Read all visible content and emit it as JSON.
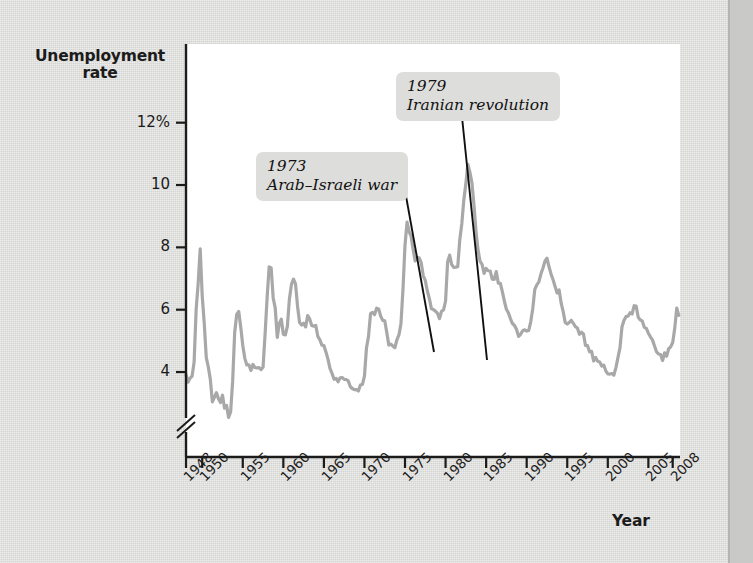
{
  "figure": {
    "background_color": "#dcdcda",
    "plot_background_color": "#ffffff",
    "line_color": "#a8a8a8",
    "axis_color": "#1b1b1b",
    "callout_bg_color": "#dddddb"
  },
  "axes": {
    "y_title": "Unemployment\nrate",
    "x_title": "Year",
    "y_ticks": [
      {
        "value": 12,
        "label": "12%"
      },
      {
        "value": 10,
        "label": "10"
      },
      {
        "value": 8,
        "label": "8"
      },
      {
        "value": 6,
        "label": "6"
      },
      {
        "value": 4,
        "label": "4"
      }
    ],
    "x_ticks": [
      {
        "value": 1948,
        "label": "1948"
      },
      {
        "value": 1950,
        "label": "1950"
      },
      {
        "value": 1955,
        "label": "1955"
      },
      {
        "value": 1960,
        "label": "1960"
      },
      {
        "value": 1965,
        "label": "1965"
      },
      {
        "value": 1970,
        "label": "1970"
      },
      {
        "value": 1975,
        "label": "1975"
      },
      {
        "value": 1980,
        "label": "1980"
      },
      {
        "value": 1985,
        "label": "1985"
      },
      {
        "value": 1990,
        "label": "1990"
      },
      {
        "value": 1995,
        "label": "1995"
      },
      {
        "value": 2000,
        "label": "2000"
      },
      {
        "value": 2005,
        "label": "2005"
      },
      {
        "value": 2008,
        "label": "2008"
      }
    ],
    "y_axis_break": true
  },
  "annotations": [
    {
      "id": "callout-1973",
      "year_label": "1973",
      "event_label": "Arab–Israeli war",
      "text": "1973\nArab–Israeli war",
      "leader_from": {
        "x": 406,
        "y": 196
      },
      "leader_to": {
        "x": 434,
        "y": 352
      }
    },
    {
      "id": "callout-1979",
      "year_label": "1979",
      "event_label": "Iranian revolution",
      "text": "1979\nIranian revolution",
      "leader_from": {
        "x": 462,
        "y": 117
      },
      "leader_to": {
        "x": 487,
        "y": 360
      }
    }
  ],
  "chart_data": {
    "type": "line",
    "title": "",
    "xlabel": "Year",
    "ylabel": "Unemployment rate",
    "xlim": [
      1948,
      2008.9
    ],
    "ylim": [
      2.3,
      12.6
    ],
    "grid": false,
    "legend": null,
    "y_unit": "%",
    "y_tick_values": [
      4,
      6,
      8,
      10,
      12
    ],
    "x_tick_values": [
      1948,
      1950,
      1955,
      1960,
      1965,
      1970,
      1975,
      1980,
      1985,
      1990,
      1995,
      2000,
      2005,
      2008
    ],
    "series": [
      {
        "name": "Unemployment rate",
        "color": "#a8a8a8",
        "x": [
          1948.0,
          1948.25,
          1948.5,
          1948.75,
          1949.0,
          1949.25,
          1949.5,
          1949.75,
          1950.0,
          1950.25,
          1950.5,
          1950.75,
          1951.0,
          1951.25,
          1951.5,
          1951.75,
          1952.0,
          1952.25,
          1952.5,
          1952.75,
          1953.0,
          1953.25,
          1953.5,
          1953.75,
          1954.0,
          1954.25,
          1954.5,
          1954.75,
          1955.0,
          1955.25,
          1955.5,
          1955.75,
          1956.0,
          1956.25,
          1956.5,
          1956.75,
          1957.0,
          1957.25,
          1957.5,
          1957.75,
          1958.0,
          1958.25,
          1958.5,
          1958.75,
          1959.0,
          1959.25,
          1959.5,
          1959.75,
          1960.0,
          1960.25,
          1960.5,
          1960.75,
          1961.0,
          1961.25,
          1961.5,
          1961.75,
          1962.0,
          1962.25,
          1962.5,
          1962.75,
          1963.0,
          1963.25,
          1963.5,
          1963.75,
          1964.0,
          1964.25,
          1964.5,
          1964.75,
          1965.0,
          1965.25,
          1965.5,
          1965.75,
          1966.0,
          1966.25,
          1966.5,
          1966.75,
          1967.0,
          1967.25,
          1967.5,
          1967.75,
          1968.0,
          1968.25,
          1968.5,
          1968.75,
          1969.0,
          1969.25,
          1969.5,
          1969.75,
          1970.0,
          1970.25,
          1970.5,
          1970.75,
          1971.0,
          1971.25,
          1971.5,
          1971.75,
          1972.0,
          1972.25,
          1972.5,
          1972.75,
          1973.0,
          1973.25,
          1973.5,
          1973.75,
          1974.0,
          1974.25,
          1974.5,
          1974.75,
          1975.0,
          1975.25,
          1975.5,
          1975.75,
          1976.0,
          1976.25,
          1976.5,
          1976.75,
          1977.0,
          1977.25,
          1977.5,
          1977.75,
          1978.0,
          1978.25,
          1978.5,
          1978.75,
          1979.0,
          1979.25,
          1979.5,
          1979.75,
          1980.0,
          1980.25,
          1980.5,
          1980.75,
          1981.0,
          1981.25,
          1981.5,
          1981.75,
          1982.0,
          1982.25,
          1982.5,
          1982.75,
          1983.0,
          1983.25,
          1983.5,
          1983.75,
          1984.0,
          1984.25,
          1984.5,
          1984.75,
          1985.0,
          1985.25,
          1985.5,
          1985.75,
          1986.0,
          1986.25,
          1986.5,
          1986.75,
          1987.0,
          1987.25,
          1987.5,
          1987.75,
          1988.0,
          1988.25,
          1988.5,
          1988.75,
          1989.0,
          1989.25,
          1989.5,
          1989.75,
          1990.0,
          1990.25,
          1990.5,
          1990.75,
          1991.0,
          1991.25,
          1991.5,
          1991.75,
          1992.0,
          1992.25,
          1992.5,
          1992.75,
          1993.0,
          1993.25,
          1993.5,
          1993.75,
          1994.0,
          1994.25,
          1994.5,
          1994.75,
          1995.0,
          1995.25,
          1995.5,
          1995.75,
          1996.0,
          1996.25,
          1996.5,
          1996.75,
          1997.0,
          1997.25,
          1997.5,
          1997.75,
          1998.0,
          1998.25,
          1998.5,
          1998.75,
          1999.0,
          1999.25,
          1999.5,
          1999.75,
          2000.0,
          2000.25,
          2000.5,
          2000.75,
          2001.0,
          2001.25,
          2001.5,
          2001.75,
          2002.0,
          2002.25,
          2002.5,
          2002.75,
          2003.0,
          2003.25,
          2003.5,
          2003.75,
          2004.0,
          2004.25,
          2004.5,
          2004.75,
          2005.0,
          2005.25,
          2005.5,
          2005.75,
          2006.0,
          2006.25,
          2006.5,
          2006.75,
          2007.0,
          2007.25,
          2007.5,
          2007.75,
          2008.0,
          2008.25,
          2008.5,
          2008.75
        ],
        "y": [
          3.9,
          3.7,
          3.8,
          3.8,
          4.3,
          6.0,
          6.8,
          7.9,
          6.5,
          5.5,
          4.5,
          4.2,
          3.7,
          3.1,
          3.2,
          3.4,
          3.2,
          3.0,
          3.2,
          2.8,
          2.9,
          2.6,
          2.7,
          3.7,
          5.3,
          5.8,
          6.0,
          5.4,
          4.9,
          4.5,
          4.2,
          4.2,
          4.0,
          4.2,
          4.1,
          4.1,
          4.2,
          4.1,
          4.2,
          5.2,
          6.4,
          7.4,
          7.3,
          6.4,
          6.0,
          5.1,
          5.6,
          5.7,
          5.2,
          5.2,
          5.5,
          6.3,
          6.8,
          7.0,
          6.8,
          6.1,
          5.6,
          5.5,
          5.6,
          5.5,
          5.8,
          5.7,
          5.5,
          5.5,
          5.5,
          5.2,
          5.0,
          4.9,
          4.9,
          4.6,
          4.4,
          4.1,
          3.9,
          3.8,
          3.8,
          3.7,
          3.8,
          3.8,
          3.8,
          3.8,
          3.7,
          3.6,
          3.5,
          3.4,
          3.4,
          3.4,
          3.6,
          3.6,
          3.9,
          4.8,
          5.1,
          5.9,
          5.9,
          5.9,
          6.0,
          6.0,
          5.8,
          5.7,
          5.6,
          5.3,
          4.9,
          4.9,
          4.8,
          4.8,
          5.1,
          5.2,
          5.6,
          6.6,
          8.1,
          8.8,
          8.5,
          8.3,
          7.9,
          7.5,
          7.7,
          7.7,
          7.5,
          7.1,
          6.9,
          6.6,
          6.3,
          6.0,
          6.0,
          5.9,
          5.9,
          5.7,
          5.9,
          6.0,
          6.3,
          7.5,
          7.7,
          7.4,
          7.4,
          7.4,
          7.4,
          8.3,
          8.8,
          9.5,
          10.0,
          10.7,
          10.4,
          10.1,
          9.4,
          8.5,
          7.9,
          7.5,
          7.4,
          7.2,
          7.3,
          7.3,
          7.2,
          7.0,
          7.0,
          7.2,
          6.9,
          6.8,
          6.6,
          6.3,
          6.0,
          5.9,
          5.7,
          5.5,
          5.5,
          5.3,
          5.2,
          5.2,
          5.3,
          5.4,
          5.3,
          5.3,
          5.6,
          6.1,
          6.6,
          6.8,
          6.9,
          7.1,
          7.3,
          7.6,
          7.6,
          7.4,
          7.2,
          7.0,
          6.8,
          6.5,
          6.6,
          6.2,
          6.0,
          5.6,
          5.5,
          5.6,
          5.7,
          5.6,
          5.5,
          5.4,
          5.2,
          5.3,
          5.2,
          4.9,
          4.8,
          4.7,
          4.6,
          4.4,
          4.5,
          4.4,
          4.3,
          4.2,
          4.2,
          4.1,
          4.0,
          4.0,
          4.0,
          3.9,
          4.2,
          4.4,
          4.8,
          5.5,
          5.7,
          5.8,
          5.8,
          5.9,
          5.8,
          6.1,
          6.1,
          5.8,
          5.7,
          5.6,
          5.4,
          5.4,
          5.3,
          5.1,
          5.0,
          4.9,
          4.7,
          4.6,
          4.6,
          4.4,
          4.6,
          4.5,
          4.7,
          4.8,
          4.9,
          5.4,
          6.1,
          5.8
        ]
      }
    ]
  }
}
